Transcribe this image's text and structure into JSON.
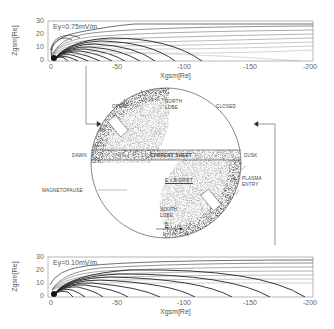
{
  "figure": {
    "top_panel": {
      "annotation": "Ey=0.75mV/m",
      "ylabel": "Zgsm[Re]",
      "xlabel": "Xgsm[Re]",
      "yticks": [
        "30",
        "20",
        "10",
        "0"
      ],
      "xticks": [
        "0",
        "-50",
        "-100",
        "-150",
        "-200"
      ]
    },
    "bottom_panel": {
      "annotation": "Ey=0.10mV/m",
      "ylabel": "Zgsm[Re]",
      "xlabel": "Xgsm[Re]",
      "yticks": [
        "30",
        "20",
        "10",
        "0"
      ],
      "xticks": [
        "0",
        "-50",
        "-100",
        "-150",
        "-200"
      ]
    },
    "cross_section": {
      "labels": {
        "open": "OPEN",
        "north_lobe": "NORTH\nLOBE",
        "closed": "CLOSED",
        "dawn": "DAWN",
        "current_sheet": "CURRENT SHEET",
        "dusk": "DUSK",
        "exb_drift": "E x B  DRIFT",
        "plasma_entry": "PLASMA\nENTRY",
        "magnetopause": "MAGNETOPAUSE",
        "south_lobe": "SOUTH\nLOBE",
        "b_vector": "B"
      }
    }
  }
}
